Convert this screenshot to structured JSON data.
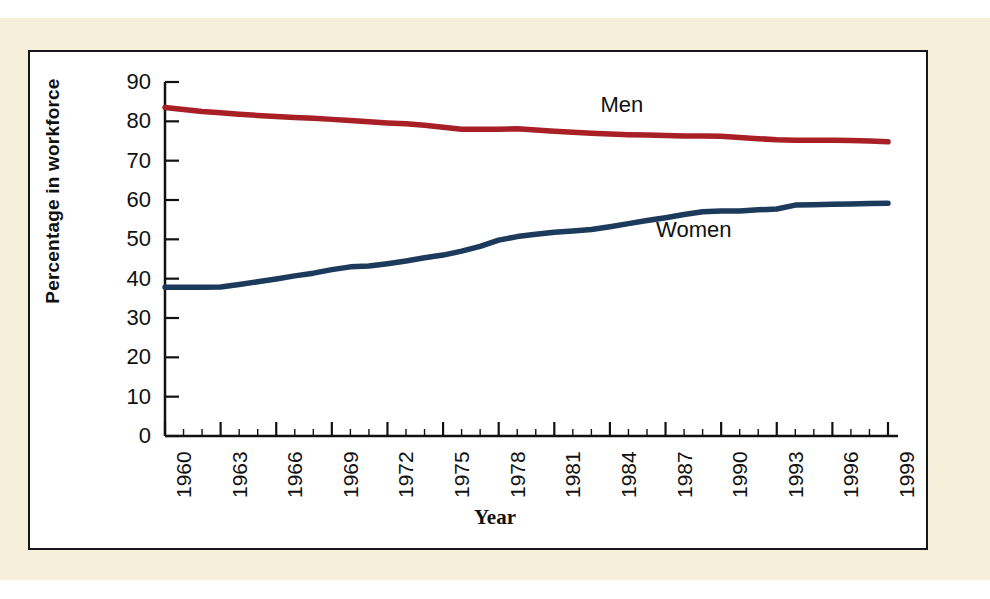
{
  "figure": {
    "background_color": "#f6f0da",
    "panel_color": "#ffffff",
    "border_color": "#17161a"
  },
  "chart_data": {
    "type": "line",
    "title": "",
    "xlabel": "Year",
    "ylabel": "Percentage in workforce",
    "xlim": [
      1960,
      1999
    ],
    "ylim": [
      0,
      90
    ],
    "grid": false,
    "legend": "inline-labels",
    "ytick_labels": [
      "90",
      "80",
      "70",
      "60",
      "50",
      "40",
      "30",
      "20",
      "10",
      "0"
    ],
    "ytick_values": [
      90,
      80,
      70,
      60,
      50,
      40,
      30,
      20,
      10,
      0
    ],
    "xtick_labels": [
      "1960",
      "1963",
      "1966",
      "1969",
      "1972",
      "1975",
      "1978",
      "1981",
      "1984",
      "1987",
      "1990",
      "1993",
      "1996",
      "1999"
    ],
    "xtick_values": [
      1960,
      1963,
      1966,
      1969,
      1972,
      1975,
      1978,
      1981,
      1984,
      1987,
      1990,
      1993,
      1996,
      1999
    ],
    "x": [
      1960,
      1961,
      1962,
      1963,
      1964,
      1965,
      1966,
      1967,
      1968,
      1969,
      1970,
      1971,
      1972,
      1973,
      1974,
      1975,
      1976,
      1977,
      1978,
      1979,
      1980,
      1981,
      1982,
      1983,
      1984,
      1985,
      1986,
      1987,
      1988,
      1989,
      1990,
      1991,
      1992,
      1993,
      1994,
      1995,
      1996,
      1997,
      1998,
      1999
    ],
    "series": [
      {
        "name": "Men",
        "color": "#a81f26",
        "label_position": {
          "x": 1985,
          "y": 84
        },
        "values": [
          83.5,
          83.0,
          82.5,
          82.2,
          81.8,
          81.5,
          81.2,
          81.0,
          80.8,
          80.5,
          80.2,
          79.9,
          79.6,
          79.4,
          79.0,
          78.5,
          78.0,
          78.0,
          78.0,
          78.1,
          77.8,
          77.5,
          77.2,
          77.0,
          76.8,
          76.6,
          76.5,
          76.4,
          76.3,
          76.3,
          76.2,
          75.9,
          75.6,
          75.3,
          75.2,
          75.2,
          75.2,
          75.1,
          75.0,
          74.8
        ]
      },
      {
        "name": "Women",
        "color": "#1b3a5c",
        "label_position": {
          "x": 1988,
          "y": 52
        },
        "values": [
          37.8,
          37.8,
          37.8,
          37.9,
          38.5,
          39.2,
          39.9,
          40.7,
          41.4,
          42.3,
          43.0,
          43.2,
          43.8,
          44.5,
          45.3,
          46.0,
          47.0,
          48.2,
          49.8,
          50.7,
          51.3,
          51.8,
          52.1,
          52.5,
          53.2,
          54.0,
          54.8,
          55.5,
          56.3,
          57.0,
          57.2,
          57.2,
          57.5,
          57.7,
          58.7,
          58.8,
          58.9,
          59.0,
          59.1,
          59.2
        ]
      }
    ]
  }
}
